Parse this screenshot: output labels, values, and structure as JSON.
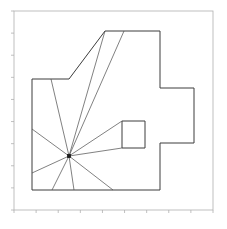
{
  "figure": {
    "name": "visibility-polygon-plot",
    "background_color": "#ffffff",
    "width": 227,
    "height": 229
  },
  "axes": {
    "frame_color": "#b0b0b0",
    "frame_width": 0.8,
    "x_range": [
      14,
      213
    ],
    "y_range": [
      11,
      210
    ],
    "grid": false,
    "tick_color": "#b0b0b0",
    "tick_length": 3,
    "xticks": [],
    "yticks": [],
    "xticklabels": [],
    "yticklabels": [],
    "title": "",
    "xlabel": "",
    "ylabel": ""
  },
  "chart_data": {
    "type": "line",
    "title": "",
    "xlabel": "",
    "ylabel": "",
    "grid": false,
    "legend": null,
    "xlim": [
      14,
      213
    ],
    "ylim": [
      11,
      210
    ],
    "series": [
      {
        "name": "outer-polygon",
        "kind": "closed-polygon",
        "color": "#3c3c3c",
        "linewidth": 1.0,
        "points": [
          [
            32,
            79
          ],
          [
            69,
            79
          ],
          [
            105,
            31
          ],
          [
            160,
            31
          ],
          [
            160,
            88
          ],
          [
            194,
            88
          ],
          [
            194,
            143
          ],
          [
            160,
            143
          ],
          [
            160,
            190
          ],
          [
            32,
            190
          ]
        ]
      },
      {
        "name": "inner-obstacle-rectangle",
        "kind": "closed-polygon",
        "color": "#3c3c3c",
        "linewidth": 1.0,
        "points": [
          [
            122,
            121
          ],
          [
            145,
            121
          ],
          [
            145,
            148
          ],
          [
            122,
            148
          ]
        ]
      },
      {
        "name": "visibility-rays",
        "kind": "rays",
        "color": "#4a4a4a",
        "linewidth": 0.7,
        "origin": [
          69,
          156
        ],
        "endpoints": [
          [
            51,
            79
          ],
          [
            105,
            31
          ],
          [
            124,
            31
          ],
          [
            122,
            148
          ],
          [
            122,
            121
          ],
          [
            32,
            129
          ],
          [
            32,
            173
          ],
          [
            52,
            190
          ],
          [
            74,
            190
          ],
          [
            113,
            190
          ]
        ]
      }
    ],
    "markers": [
      {
        "name": "viewpoint-marker",
        "x": 69,
        "y": 156,
        "color": "#1a1a1a",
        "size": 3,
        "shape": "square",
        "label": ""
      }
    ],
    "annotations": []
  }
}
